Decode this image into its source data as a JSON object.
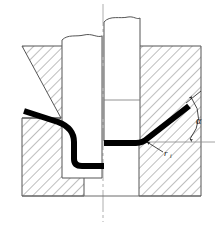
{
  "figure": {
    "kind": "engineering-drawing",
    "background_color": "#ffffff",
    "line_color": "#555555",
    "outline_color": "#4a4a4a",
    "hatch_color": "#777777",
    "workpiece_color": "#000000",
    "centerline_color": "#8a8a8a",
    "annotation_color": "#1a1a1a",
    "caption": ""
  },
  "annotations": {
    "bend_angle": {
      "label": "α",
      "name": "bend-angle-alpha",
      "x": 196,
      "y": 121
    },
    "bend_radius": {
      "label": "r",
      "subscript": "i",
      "name": "bend-radius-r",
      "x": 160,
      "y": 152
    }
  },
  "geometry": {
    "left_die": {
      "name": "left-die-block",
      "outline": "22,46 84,46 84,196 22,196 22,117 60,117",
      "chamfer": "22,117 60,117"
    },
    "right_die": {
      "name": "right-die-block",
      "outline": "139,46 201,46 201,196 139,196"
    },
    "left_punch": {
      "name": "left-punch",
      "outline": "62,35 102,35 102,178 62,178"
    },
    "right_punch": {
      "name": "right-punch",
      "outline": "104,16 140,16 140,141 104,141"
    },
    "base_line": {
      "name": "base-line",
      "y": 196,
      "x1": 22,
      "x2": 201
    },
    "centerline": {
      "name": "vertical-centerline",
      "x": 103,
      "y1": 4,
      "y2": 222
    },
    "horizontal_reference": {
      "name": "horizontal-reference-line",
      "y": 142,
      "x1": 139,
      "x2": 215
    },
    "workpiece_path": {
      "name": "sheet-metal-workpiece",
      "points": "25,112 62,124 74,136 74,160 103,166 138,143 174,117 190,107",
      "thickness": 6
    }
  }
}
